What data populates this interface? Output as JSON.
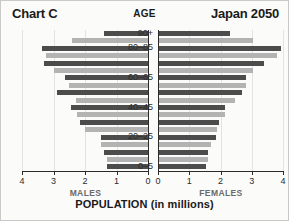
{
  "header": {
    "left_title": "Chart C",
    "center_title": "AGE",
    "right_title": "Japan 2050"
  },
  "footer": {
    "males_label": "MALES",
    "females_label": "FEMALES",
    "axis_title": "POPULATION (in millions)"
  },
  "colors": {
    "bar_dark": "#4c4c4c",
    "bar_light": "#b3b3b3",
    "axis": "#2b2b2b",
    "grid": "#e3e3e0",
    "background": "#fbfbfa"
  },
  "chart_data": {
    "type": "bar",
    "subtitle": "AGE",
    "xlabel": "POPULATION (in millions)",
    "ylabel": "AGE",
    "orientation": "horizontal",
    "layout": "population-pyramid",
    "grid": true,
    "legend_position": "none",
    "xlim_male": [
      4,
      0
    ],
    "xlim_female": [
      0,
      4
    ],
    "male_ticks": [
      4,
      3,
      2,
      1,
      0
    ],
    "female_ticks": [
      0,
      1,
      2,
      3,
      4
    ],
    "male_tick_labels": [
      "4",
      "3",
      "2",
      "1",
      "0"
    ],
    "female_tick_labels": [
      "0",
      "1",
      "2",
      "3",
      "4"
    ],
    "categories": [
      "90+",
      "85-90",
      "80-85",
      "75-80",
      "70-75",
      "65-70",
      "60-65",
      "55-60",
      "50-55",
      "45-50",
      "40-45",
      "35-40",
      "30-35",
      "25-30",
      "20-25",
      "15-20",
      "10-15",
      "5-10",
      "0-5"
    ],
    "visible_category_labels": [
      {
        "index": 0,
        "label": "90+"
      },
      {
        "index": 2,
        "label": "80–85"
      },
      {
        "index": 6,
        "label": "60–65"
      },
      {
        "index": 10,
        "label": "40–45"
      },
      {
        "index": 14,
        "label": "20–25"
      },
      {
        "index": 18,
        "label": "0–5"
      }
    ],
    "bar_shades": [
      "dark",
      "light",
      "dark",
      "light",
      "dark",
      "light",
      "dark",
      "light",
      "dark",
      "light",
      "dark",
      "light",
      "dark",
      "light",
      "dark",
      "light",
      "dark",
      "light",
      "dark"
    ],
    "series": [
      {
        "name": "MALES",
        "side": "left",
        "values": [
          1.4,
          2.4,
          3.35,
          3.25,
          3.3,
          3.0,
          2.65,
          2.5,
          2.9,
          2.3,
          2.45,
          2.25,
          2.15,
          2.0,
          1.5,
          1.5,
          1.4,
          1.3,
          1.3
        ]
      },
      {
        "name": "FEMALES",
        "side": "right",
        "values": [
          2.3,
          3.05,
          3.95,
          3.8,
          3.4,
          3.05,
          2.8,
          2.8,
          2.7,
          2.45,
          2.15,
          2.15,
          1.95,
          1.9,
          1.85,
          1.7,
          1.6,
          1.6,
          1.55
        ]
      }
    ]
  }
}
